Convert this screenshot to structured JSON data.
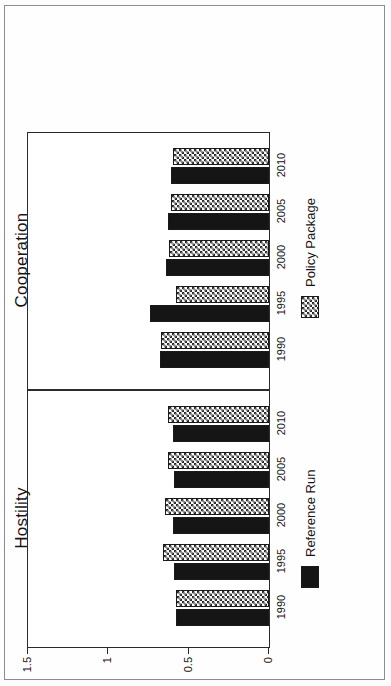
{
  "figure": {
    "orientation_note": "rotated-90-ccw",
    "ylabel": "Reactivity"
  },
  "chart_data": {
    "type": "bar",
    "title": "",
    "xlabel": "",
    "ylabel": "Reactivity",
    "ylim": [
      0,
      1.5
    ],
    "yticks": [
      0,
      0.5,
      1,
      1.5
    ],
    "ytick_labels": [
      "0",
      "0.5",
      "1",
      "1.5"
    ],
    "grid": false,
    "legend_position": "bottom",
    "categories": [
      "1990",
      "1995",
      "2000",
      "2005",
      "2010"
    ],
    "panels": [
      {
        "name": "Hostility",
        "series": [
          {
            "name": "Reference Run",
            "values": [
              0.58,
              0.59,
              0.6,
              0.59,
              0.6
            ]
          },
          {
            "name": "Policy Package",
            "values": [
              0.58,
              0.66,
              0.65,
              0.63,
              0.63
            ]
          }
        ]
      },
      {
        "name": "Cooperation",
        "series": [
          {
            "name": "Reference Run",
            "values": [
              0.68,
              0.74,
              0.64,
              0.63,
              0.61
            ]
          },
          {
            "name": "Policy Package",
            "values": [
              0.67,
              0.58,
              0.62,
              0.61,
              0.6
            ]
          }
        ]
      }
    ],
    "legend": [
      {
        "label": "Reference Run",
        "fill": "solid-black",
        "color": "#151515"
      },
      {
        "label": "Policy Package",
        "fill": "checkered",
        "color": "#2a2a2a"
      }
    ]
  },
  "panel_titles": {
    "left": "Hostility",
    "right": "Cooperation"
  }
}
